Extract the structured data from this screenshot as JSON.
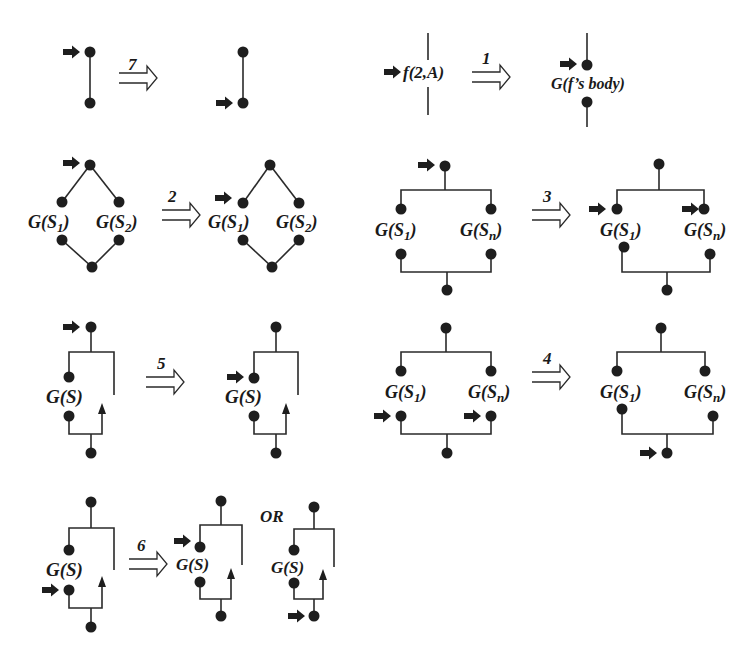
{
  "figure": {
    "rules": [
      {
        "id": "rule-7",
        "number": "7",
        "left": {
          "type": "edge",
          "marker_at": "top"
        },
        "right": {
          "type": "edge",
          "marker_at": "bottom"
        }
      },
      {
        "id": "rule-1",
        "number": "1",
        "left": {
          "label": "f(2,A)",
          "type": "call"
        },
        "right": {
          "label": "G(f's body)",
          "type": "inline-body"
        }
      },
      {
        "id": "rule-2",
        "number": "2",
        "left": {
          "labels": [
            "G(S1)",
            "G(S2)"
          ],
          "type": "diamond",
          "marker_at": "top"
        },
        "right": {
          "labels": [
            "G(S1)",
            "G(S2)"
          ],
          "type": "diamond",
          "marker_at": "left-branch"
        }
      },
      {
        "id": "rule-3",
        "number": "3",
        "left": {
          "labels": [
            "G(S1)",
            "G(Sn)"
          ],
          "type": "parallel",
          "marker_at": "top"
        },
        "right": {
          "labels": [
            "G(S1)",
            "G(Sn)"
          ],
          "type": "parallel",
          "marker_at": "all-branch-entries"
        }
      },
      {
        "id": "rule-5",
        "number": "5",
        "left": {
          "label": "G(S)",
          "type": "loop",
          "marker_at": "top"
        },
        "right": {
          "label": "G(S)",
          "type": "loop",
          "marker_at": "body-entry"
        }
      },
      {
        "id": "rule-4",
        "number": "4",
        "left": {
          "labels": [
            "G(S1)",
            "G(Sn)"
          ],
          "type": "parallel",
          "marker_at": "all-branch-exits"
        },
        "right": {
          "labels": [
            "G(S1)",
            "G(Sn)"
          ],
          "type": "parallel",
          "marker_at": "bottom"
        }
      },
      {
        "id": "rule-6",
        "number": "6",
        "left": {
          "label": "G(S)",
          "type": "loop",
          "marker_at": "body-exit"
        },
        "right": {
          "label": "G(S)",
          "type": "loop",
          "marker_at": "body-entry"
        },
        "alternative_label": "OR",
        "alternative": {
          "label": "G(S)",
          "type": "loop",
          "marker_at": "bottom"
        }
      }
    ]
  },
  "labels": {
    "r7": "7",
    "r1": "1",
    "r2": "2",
    "r3": "3",
    "r5": "5",
    "r4": "4",
    "r6": "6",
    "or": "OR",
    "f2a": "f(2,A)",
    "fbody": "G(f’s body)",
    "G": "G(S",
    "s1": "1",
    "s2": "2",
    "sn": "n",
    "close": ")",
    "gs": "G(S)"
  },
  "colors": {
    "ink": "#1e1e1e",
    "background": "#ffffff"
  }
}
